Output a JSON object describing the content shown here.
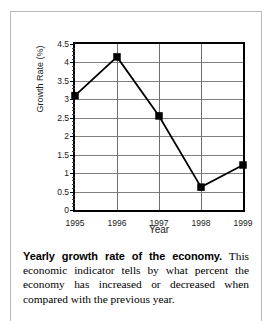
{
  "chart_data": {
    "type": "line",
    "title": "",
    "xlabel": "Year",
    "ylabel": "Growth Rate (%)",
    "categories": [
      "1995",
      "1996",
      "1997",
      "1998",
      "1999"
    ],
    "values": [
      3.1,
      4.15,
      2.55,
      0.62,
      1.22
    ],
    "series": [
      {
        "name": "Growth Rate",
        "values": [
          3.1,
          4.15,
          2.55,
          0.62,
          1.22
        ]
      }
    ],
    "ylim": [
      0,
      4.5
    ],
    "yticks": [
      "0",
      "0.5",
      "1",
      "1.5",
      "2",
      "2.5",
      "3",
      "3.5",
      "4",
      "4.5"
    ],
    "ytick_values": [
      0,
      0.5,
      1,
      1.5,
      2,
      2.5,
      3,
      3.5,
      4,
      4.5
    ],
    "xtick_labels": [
      "1995",
      "1996",
      "1997",
      "1998",
      "1999"
    ],
    "grid": "horizontal and vertical",
    "legend": "none",
    "marker": "filled black square",
    "line_color": "#000000",
    "grid_color": "#808080",
    "frame_color": "#000000"
  },
  "caption": {
    "lead": "Yearly growth rate of the economy.",
    "body": " This economic indicator tells by what percent the economy has increased or decreased when compared with the previous year."
  }
}
